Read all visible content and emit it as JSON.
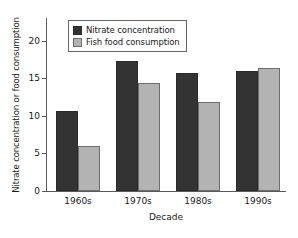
{
  "chart_data": {
    "type": "bar",
    "title": "",
    "xlabel": "Decade",
    "ylabel": "Nitrate concentration or food consumption",
    "categories": [
      "1960s",
      "1970s",
      "1980s",
      "1990s"
    ],
    "series": [
      {
        "name": "Nitrate concentration",
        "color": "#333333",
        "values": [
          10.7,
          17.3,
          15.7,
          16.0
        ]
      },
      {
        "name": "Fish food consumption",
        "color": "#b3b3b3",
        "values": [
          6.0,
          14.3,
          11.9,
          16.3
        ]
      }
    ],
    "ylim": [
      0,
      23
    ],
    "yticks": [
      0,
      5,
      10,
      15,
      20
    ],
    "ytick_labels": [
      "0",
      "5",
      "10",
      "15",
      "20"
    ],
    "grid": false,
    "legend_position": "top-left-inside"
  }
}
